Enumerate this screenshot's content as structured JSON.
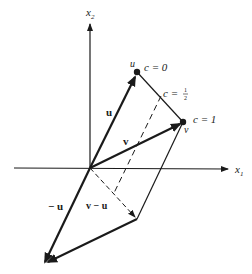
{
  "figure": {
    "axes": {
      "x1_label": "x",
      "x1_sub": "1",
      "x2_label": "x",
      "x2_sub": "2"
    },
    "points": {
      "u": {
        "label": "u",
        "c_label": "c = 0"
      },
      "mid": {
        "c_label_prefix": "c = ",
        "c_num": "1",
        "c_den": "2"
      },
      "v": {
        "label": "v",
        "c_label": "c = 1"
      }
    },
    "vectors": {
      "u": "u",
      "v": "v",
      "neg_u": "− u",
      "v_minus_u": "v − u"
    }
  }
}
